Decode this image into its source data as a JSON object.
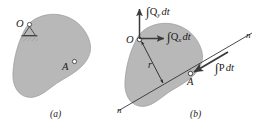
{
  "figure": {
    "colors": {
      "body_fill": "#b8b8b8",
      "body_stroke": "#8c8c8c",
      "line": "#262626",
      "arrow": "#3a3a3a",
      "text": "#1a1a1a",
      "background": "#ffffff"
    },
    "panels": [
      {
        "id": "a",
        "caption": "(a)",
        "labels": {
          "origin": "O",
          "point_a": "A"
        },
        "support_icon": "pin-support-icon",
        "markers": [
          {
            "name": "origin-marker",
            "label": "O"
          },
          {
            "name": "point-a-marker",
            "label": "A"
          }
        ]
      },
      {
        "id": "b",
        "caption": "(b)",
        "labels": {
          "origin": "O",
          "point_a": "A",
          "radius": "r",
          "normal_top": "n",
          "normal_bottom": "n"
        },
        "vectors": [
          {
            "name": "impulse-qy",
            "integral": "∫",
            "symbol": "Q",
            "subscript": "y",
            "differential": "dt",
            "direction": "up",
            "anchor": "O"
          },
          {
            "name": "impulse-qx",
            "integral": "∫",
            "symbol": "Q",
            "subscript": "x",
            "differential": "dt",
            "direction": "right",
            "anchor": "O"
          },
          {
            "name": "impulse-p",
            "integral": "∫",
            "symbol": "P",
            "subscript": "",
            "differential": "dt",
            "direction": "down-left",
            "anchor": "A"
          }
        ]
      }
    ]
  }
}
